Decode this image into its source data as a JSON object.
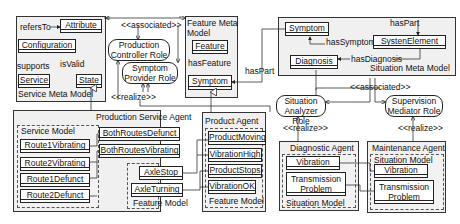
{
  "service_meta_model": {
    "title": "Service Meta Model",
    "classes": [
      "Attribute",
      "Configuration",
      "Service",
      "State"
    ],
    "relations": [
      "refersTo",
      "supports",
      "isValid"
    ]
  },
  "feature_meta_model": {
    "title_line1": "Feature Meta",
    "title_line2": "Model",
    "classes": [
      "Feature",
      "Symptom"
    ],
    "relations": [
      "hasFeature"
    ]
  },
  "situation_meta_model": {
    "title": "Situation Meta Model",
    "classes": [
      "Symptom",
      "SystenElement",
      "Diagnosis"
    ],
    "relations": [
      "hasPart",
      "hasSymptom",
      "hasDiagnosis"
    ]
  },
  "roles": {
    "production_controller": [
      "Production",
      "Controller Role"
    ],
    "symptom_provider": [
      "Symptom",
      "Provider Role"
    ],
    "situation_analyzer": [
      "Situation",
      "Analyzer Role"
    ],
    "supervision_mediator": [
      "Supervision",
      "Mediator Role"
    ]
  },
  "stereotypes": {
    "associated": "<<associated>>",
    "realize": "<<realize>>"
  },
  "has_part_label": "hasPart",
  "production_service_agent": {
    "title": "Production Service Agent",
    "service_model": {
      "title": "Service Model",
      "items": [
        "Route1Vibrating",
        "Route2Vibrating",
        "Route1Defunct",
        "Route2Defunct"
      ]
    },
    "other_items": [
      "BothRoutesDefunct",
      "BothRoutesVibrating"
    ],
    "feature_model": {
      "title": "Feature Model",
      "items": [
        "AxleStop",
        "AxleTurning"
      ]
    }
  },
  "product_agent": {
    "title": "Product Agent",
    "feature_model": {
      "title": "Feature Model",
      "items": [
        "ProductMoving",
        "VibrationHigh",
        "ProductStops",
        "VibrationOK"
      ]
    }
  },
  "diagnostic_agent": {
    "title": "Diagnostic Agent",
    "situation_model": {
      "title": "Situation Model",
      "items": [
        "Vibration",
        "Transmission",
        "Problem"
      ]
    }
  },
  "maintenance_agent": {
    "title": "Maintenance Agent",
    "situation_model": {
      "title": "Situation Model",
      "items": [
        "Vibration",
        "Transmission",
        "Problem"
      ]
    }
  }
}
